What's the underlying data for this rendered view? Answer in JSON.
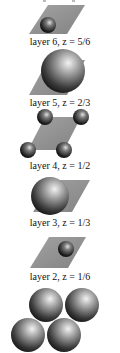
{
  "figure": {
    "title_fragment": "",
    "layers": [
      {
        "label": "layer 6, z = 5/6",
        "layer": "layer 6",
        "z": "5/6"
      },
      {
        "label": "layer 5, z = 2/3",
        "layer": "layer 5",
        "z": "2/3"
      },
      {
        "label": "layer 4, z = 1/2",
        "layer": "layer 4",
        "z": "1/2"
      },
      {
        "label": "layer 3, z = 1/3",
        "layer": "layer 3",
        "z": "1/3"
      },
      {
        "label": "layer 2, z = 1/6",
        "layer": "layer 2",
        "z": "1/6"
      }
    ],
    "bottom_layer": {
      "sphere_count": 4
    },
    "colors": {
      "plane": "#8f8f8f",
      "sphere_dark": "#151515",
      "sphere_light": "#e6e6e6",
      "text": "#111111"
    }
  }
}
